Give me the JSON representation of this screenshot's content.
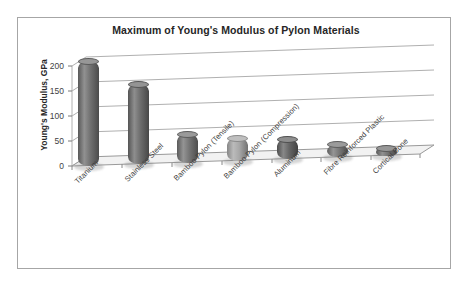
{
  "frame": {
    "border_color": "#a6a6a6",
    "background": "#ffffff"
  },
  "chart_data": {
    "type": "bar",
    "title": "Maximum of Young's Modulus of Pylon Materials",
    "xlabel": "",
    "ylabel": "Young's Modulus, GPa",
    "ylim": [
      0,
      220
    ],
    "yticks": [
      0,
      50,
      100,
      150,
      200
    ],
    "ytick_labels": [
      "0",
      "50",
      "100",
      "150",
      "200"
    ],
    "grid": true,
    "legend": "none",
    "three_d": true,
    "categories": [
      "Titanium",
      "Stainless Steel",
      "Bamboo Pylon (Tensile)",
      "Bamboo Pylon (Compression)",
      "Aluminum",
      "Fibre Reinforced Plastic",
      "Cortical Bone"
    ],
    "values": [
      210,
      160,
      57,
      45,
      40,
      25,
      15
    ],
    "colors": [
      "#6b6b6b",
      "#666666",
      "#6e6e6e",
      "#a3a3a3",
      "#5e5e5e",
      "#707070",
      "#6a6a6a"
    ]
  }
}
